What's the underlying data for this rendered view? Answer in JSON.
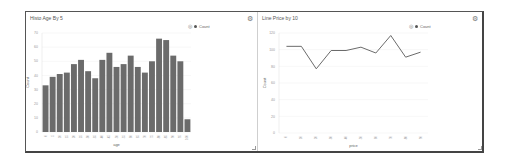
{
  "panels": [
    {
      "title": "Histo Age By 5",
      "legend_label": "Count",
      "settings_icon": "gear-icon"
    },
    {
      "title": "Line Price by 10",
      "legend_label": "Count",
      "settings_icon": "gear-icon"
    }
  ],
  "colors": {
    "bar": "#6b6b6b",
    "line": "#6b6b6b",
    "grid": "#eeeeee",
    "axis_text": "#999999"
  },
  "chart_data": [
    {
      "type": "bar",
      "title": "Histo Age By 5",
      "xlabel": "age",
      "ylabel": "Count",
      "categories": [
        "0",
        "5",
        "10",
        "15",
        "20",
        "25",
        "30",
        "35",
        "40",
        "45",
        "50",
        "55",
        "60",
        "65",
        "70",
        "75",
        "80",
        "85",
        "90",
        "95",
        "100"
      ],
      "series": [
        {
          "name": "Count",
          "values": [
            33,
            39,
            41,
            42,
            48,
            51,
            43,
            38,
            51,
            56,
            46,
            48,
            54,
            46,
            42,
            50,
            66,
            65,
            54,
            50,
            9
          ]
        }
      ],
      "yticks": [
        0,
        10,
        20,
        30,
        40,
        50,
        60,
        70
      ],
      "ylim": [
        0,
        70
      ],
      "grid": true,
      "legend_position": "top-right"
    },
    {
      "type": "line",
      "title": "Line Price by 10",
      "xlabel": "price",
      "ylabel": "Count",
      "categories": [
        "0",
        "10",
        "20",
        "30",
        "40",
        "50",
        "60",
        "70",
        "80",
        "90"
      ],
      "series": [
        {
          "name": "Count",
          "values": [
            104,
            104,
            77,
            99,
            99,
            103,
            96,
            117,
            91,
            97
          ]
        }
      ],
      "yticks": [
        0,
        20,
        40,
        60,
        80,
        100,
        120
      ],
      "ylim": [
        0,
        120
      ],
      "grid": true,
      "legend_position": "top-right"
    }
  ]
}
